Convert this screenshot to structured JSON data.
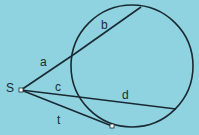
{
  "diagram": {
    "type": "secant-tangent circle geometry",
    "background_color": "#8fd3e0",
    "stroke_color": "#1a2a33",
    "point_fill": "#ffffff",
    "external_point": {
      "label": "S",
      "x": 21,
      "y": 90
    },
    "circle": {
      "cx": 132,
      "cy": 66,
      "r": 61
    },
    "segments": [
      {
        "label": "a",
        "desc": "external part of upper secant",
        "x1": 21,
        "y1": 90,
        "x2": 73,
        "y2": 55,
        "label_x": 40,
        "label_y": 66
      },
      {
        "label": "b",
        "desc": "chord part of upper secant",
        "x1": 73,
        "y1": 55,
        "x2": 141,
        "y2": 7,
        "label_x": 101,
        "label_y": 29
      },
      {
        "label": "c",
        "desc": "external part of lower secant",
        "x1": 21,
        "y1": 90,
        "x2": 79,
        "y2": 97,
        "label_x": 55,
        "label_y": 91
      },
      {
        "label": "d",
        "desc": "chord part of lower secant",
        "x1": 79,
        "y1": 97,
        "x2": 176,
        "y2": 109,
        "label_x": 122,
        "label_y": 99
      },
      {
        "label": "t",
        "desc": "tangent segment",
        "x1": 21,
        "y1": 90,
        "x2": 112,
        "y2": 126,
        "label_x": 57,
        "label_y": 124
      }
    ],
    "tangent_point": {
      "x": 112,
      "y": 126
    }
  }
}
